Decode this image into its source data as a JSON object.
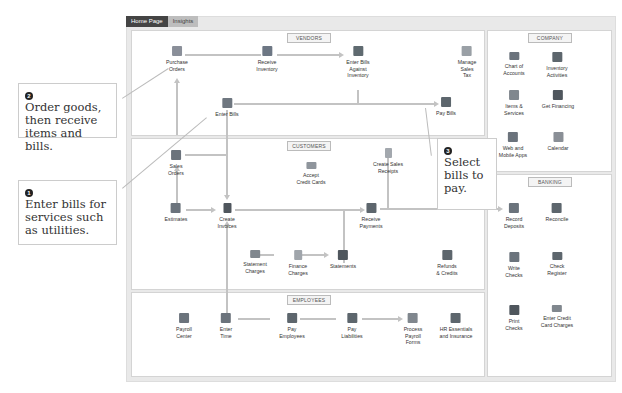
{
  "tabs": [
    {
      "label": "Home Page",
      "active": true
    },
    {
      "label": "Insights",
      "active": false
    }
  ],
  "vendors": {
    "title": "VENDORS",
    "items": [
      {
        "label1": "Purchase",
        "label2": "Orders"
      },
      {
        "label1": "Receive",
        "label2": "Inventory"
      },
      {
        "label1": "Enter Bills",
        "label2": "Against",
        "label3": "Inventory"
      },
      {
        "label1": "Manage",
        "label2": "Sales",
        "label3": "Tax"
      },
      {
        "label1": "Enter Bills"
      },
      {
        "label1": "Pay Bills"
      }
    ]
  },
  "customers": {
    "title": "CUSTOMERS",
    "items": [
      {
        "label1": "Sales",
        "label2": "Orders"
      },
      {
        "label1": "Accept",
        "label2": "Credit Cards"
      },
      {
        "label1": "Create Sales",
        "label2": "Receipts"
      },
      {
        "label1": "Estimates"
      },
      {
        "label1": "Create",
        "label2": "Invoices"
      },
      {
        "label1": "Receive",
        "label2": "Payments"
      },
      {
        "label1": "Statement",
        "label2": "Charges"
      },
      {
        "label1": "Finance",
        "label2": "Charges"
      },
      {
        "label1": "Statements"
      },
      {
        "label1": "Refunds",
        "label2": "& Credits"
      }
    ]
  },
  "employees": {
    "title": "EMPLOYEES",
    "items": [
      {
        "label1": "Payroll",
        "label2": "Center"
      },
      {
        "label1": "Enter",
        "label2": "Time"
      },
      {
        "label1": "Pay",
        "label2": "Employees"
      },
      {
        "label1": "Pay",
        "label2": "Liabilities"
      },
      {
        "label1": "Process",
        "label2": "Payroll",
        "label3": "Forms"
      },
      {
        "label1": "HR Essentials",
        "label2": "and Insurance"
      }
    ]
  },
  "company": {
    "title": "COMPANY",
    "items": [
      {
        "label1": "Chart of",
        "label2": "Accounts"
      },
      {
        "label1": "Inventory",
        "label2": "Activities"
      },
      {
        "label1": "Items &",
        "label2": "Services"
      },
      {
        "label1": "Get Financing"
      },
      {
        "label1": "Web and",
        "label2": "Mobile Apps"
      },
      {
        "label1": "Calendar"
      }
    ]
  },
  "banking": {
    "title": "BANKING",
    "items": [
      {
        "label1": "Record",
        "label2": "Deposits"
      },
      {
        "label1": "Reconcile"
      },
      {
        "label1": "Write",
        "label2": "Checks"
      },
      {
        "label1": "Check",
        "label2": "Register"
      },
      {
        "label1": "Print",
        "label2": "Checks"
      },
      {
        "label1": "Enter Credit",
        "label2": "Card Charges"
      }
    ]
  },
  "callouts": [
    {
      "number": "2",
      "text": "Order goods, then receive items and bills."
    },
    {
      "number": "1",
      "text": "Enter bills for services such as utilities."
    },
    {
      "number": "3",
      "text": "Select bills to pay."
    }
  ]
}
